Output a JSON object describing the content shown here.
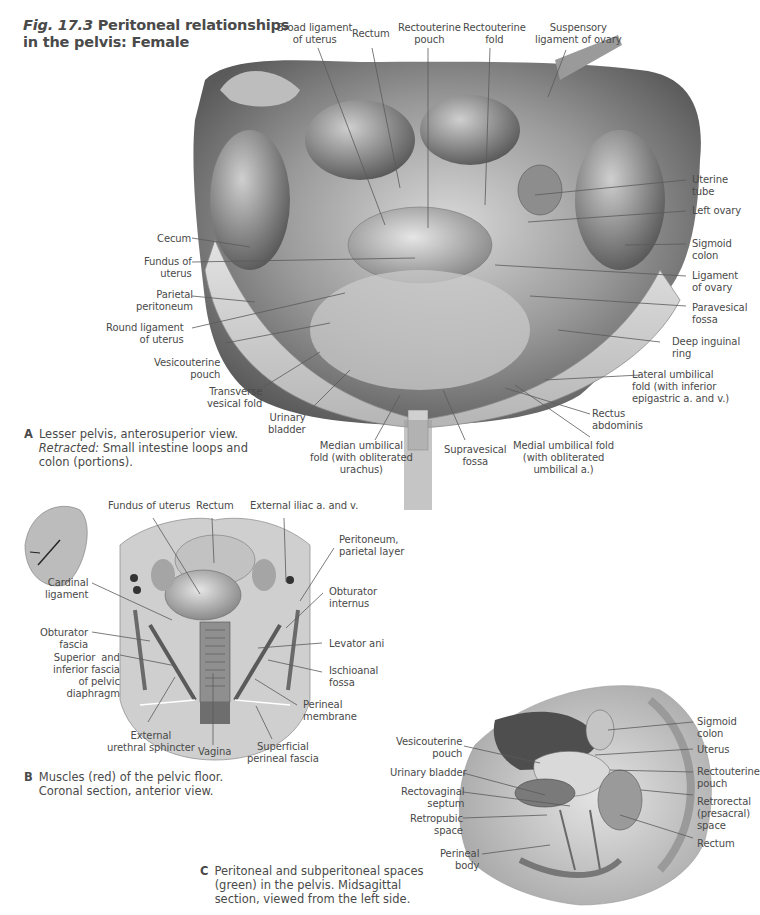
{
  "figure": {
    "number": "Fig. 17.3",
    "title_line1": "Peritoneal relationships",
    "title_line2": "in the pelvis: Female"
  },
  "panel_a": {
    "letter": "A",
    "caption_line1": "Lesser pelvis, anterosuperior view.",
    "caption_retracted_label": "Retracted:",
    "caption_line2_rest": " Small intestine loops and",
    "caption_line3": "colon (portions).",
    "labels": {
      "broad_ligament": "Broad ligament\nof uterus",
      "rectum": "Rectum",
      "rectouterine_pouch": "Rectouterine\npouch",
      "rectouterine_fold": "Rectouterine\nfold",
      "suspensory_ligament": "Suspensory\nligament of ovary",
      "uterine_tube": "Uterine\ntube",
      "left_ovary": "Left ovary",
      "sigmoid_colon": "Sigmoid\ncolon",
      "ligament_of_ovary": "Ligament\nof ovary",
      "paravesical_fossa": "Paravesical\nfossa",
      "deep_inguinal_ring": "Deep inguinal\nring",
      "lateral_umbilical_fold": "Lateral umbilical\nfold (with inferior\nepigastric a. and v.)",
      "rectus_abdominis": "Rectus\nabdominis",
      "medial_umbilical_fold": "Medial umbilical fold\n(with obliterated\numbilical a.)",
      "supravesical_fossa": "Supravesical\nfossa",
      "median_umbilical_fold": "Median umbilical\nfold (with obliterated\nurachus)",
      "urinary_bladder": "Urinary\nbladder",
      "transverse_vesical_fold": "Transverse\nvesical fold",
      "vesicouterine_pouch": "Vesicouterine\npouch",
      "round_ligament": "Round ligament\nof uterus",
      "parietal_peritoneum": "Parietal\nperitoneum",
      "fundus_of_uterus": "Fundus of\nuterus",
      "cecum": "Cecum"
    }
  },
  "panel_b": {
    "letter": "B",
    "caption_line1": "Muscles (red) of the pelvic floor.",
    "caption_line2": "Coronal section, anterior view.",
    "labels": {
      "fundus_of_uterus": "Fundus of uterus",
      "rectum": "Rectum",
      "external_iliac": "External iliac a. and v.",
      "peritoneum_parietal": "Peritoneum,\nparietal layer",
      "obturator_internus": "Obturator\ninternus",
      "levator_ani": "Levator ani",
      "ischioanal_fossa": "Ischioanal\nfossa",
      "perineal_membrane": "Perineal\nmembrane",
      "superficial_perineal_fascia": "Superficial\nperineal fascia",
      "vagina": "Vagina",
      "external_urethral_sphincter": "External\nurethral sphincter",
      "superior_inferior_fascia": "Superior  and\ninferior fascia\nof pelvic\ndiaphragm",
      "obturator_fascia": "Obturator\nfascia",
      "cardinal_ligament": "Cardinal\nligament"
    }
  },
  "panel_c": {
    "letter": "C",
    "caption_line1": "Peritoneal and subperitoneal spaces",
    "caption_line2": "(green) in the pelvis. Midsagittal",
    "caption_line3": "section, viewed from the left side.",
    "labels": {
      "vesicouterine_pouch": "Vesicouterine\npouch",
      "urinary_bladder": "Urinary bladder",
      "rectovaginal_septum": "Rectovaginal\nseptum",
      "retropubic_space": "Retropubic\nspace",
      "perineal_body": "Perineal\nbody",
      "sigmoid_colon": "Sigmoid\ncolon",
      "uterus": "Uterus",
      "rectouterine_pouch": "Rectouterine\npouch",
      "retrorectal_space": "Retrorectal\n(presacral)\nspace",
      "rectum": "Rectum"
    }
  }
}
